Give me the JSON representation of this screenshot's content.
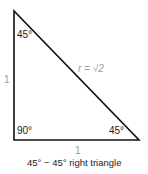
{
  "diagram": {
    "title": "45° − 45° right triangle",
    "angles": {
      "top": "45°",
      "bottom_left": "90°",
      "bottom_right": "45°"
    },
    "sides": {
      "left": "1",
      "bottom": "1",
      "hypotenuse": "r = √2"
    },
    "colors": {
      "stroke": "#111111",
      "label": "#222222",
      "muted_label": "#9a9a9a"
    }
  }
}
